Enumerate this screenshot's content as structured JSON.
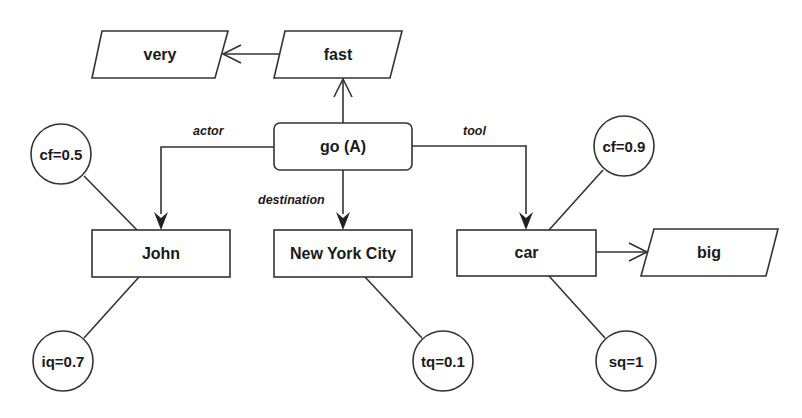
{
  "diagram": {
    "type": "semantic-network",
    "colors": {
      "stroke": "#333333",
      "text": "#1a1a1a",
      "background": "#ffffff"
    },
    "nodes": {
      "go": {
        "label": "go (A)",
        "shape": "rounded-rect"
      },
      "fast": {
        "label": "fast",
        "shape": "parallelogram"
      },
      "very": {
        "label": "very",
        "shape": "parallelogram"
      },
      "john": {
        "label": "John",
        "shape": "rect"
      },
      "nyc": {
        "label": "New York City",
        "shape": "rect"
      },
      "car": {
        "label": "car",
        "shape": "rect"
      },
      "big": {
        "label": "big",
        "shape": "parallelogram"
      },
      "cf_john": {
        "label": "cf=0.5",
        "shape": "circle"
      },
      "iq_john": {
        "label": "iq=0.7",
        "shape": "circle"
      },
      "tq_nyc": {
        "label": "tq=0.1",
        "shape": "circle"
      },
      "cf_car": {
        "label": "cf=0.9",
        "shape": "circle"
      },
      "sq_car": {
        "label": "sq=1",
        "shape": "circle"
      }
    },
    "edges": {
      "actor": {
        "label": "actor",
        "from": "go (A)",
        "to": "John"
      },
      "destination": {
        "label": "destination",
        "from": "go (A)",
        "to": "New York City"
      },
      "tool": {
        "label": "tool",
        "from": "go (A)",
        "to": "car"
      },
      "go_fast": {
        "from": "go (A)",
        "to": "fast"
      },
      "fast_very": {
        "from": "fast",
        "to": "very"
      },
      "car_big": {
        "from": "car",
        "to": "big"
      }
    }
  }
}
